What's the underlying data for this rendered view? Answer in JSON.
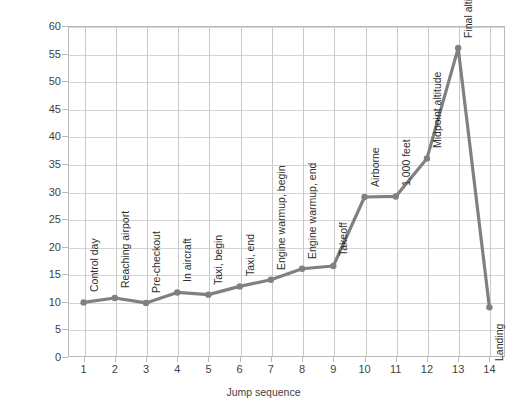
{
  "chart_data": {
    "type": "line",
    "title": "",
    "xlabel": "Jump sequence",
    "ylabel": "Conductance in microohms",
    "xlim": [
      0.5,
      14.5
    ],
    "ylim": [
      0,
      60
    ],
    "grid": true,
    "legend": "none",
    "x": [
      1,
      2,
      3,
      4,
      5,
      6,
      7,
      8,
      9,
      10,
      11,
      12,
      13,
      14
    ],
    "values": [
      9.9,
      10.7,
      9.8,
      11.7,
      11.3,
      12.8,
      14.0,
      16.0,
      16.5,
      29.0,
      29.1,
      36.0,
      56.0,
      9.0
    ],
    "categories": [
      "1",
      "2",
      "3",
      "4",
      "5",
      "6",
      "7",
      "8",
      "9",
      "10",
      "11",
      "12",
      "13",
      "14"
    ],
    "x_tick_labels": [
      "1",
      "2",
      "3",
      "4",
      "5",
      "6",
      "7",
      "8",
      "9",
      "10",
      "11",
      "12",
      "13",
      "14"
    ],
    "y_tick_labels": [
      "0",
      "5",
      "10",
      "15",
      "20",
      "25",
      "30",
      "35",
      "40",
      "45",
      "50",
      "55",
      "60"
    ],
    "y_ticks": [
      0,
      5,
      10,
      15,
      20,
      25,
      30,
      35,
      40,
      45,
      50,
      55,
      60
    ],
    "annotations": [
      {
        "x": 1,
        "text": "Control day"
      },
      {
        "x": 2,
        "text": "Reaching airport"
      },
      {
        "x": 3,
        "text": "Pre-checkout"
      },
      {
        "x": 4,
        "text": "In aircraft"
      },
      {
        "x": 5,
        "text": "Taxi, begin"
      },
      {
        "x": 6,
        "text": "Taxi, end"
      },
      {
        "x": 7,
        "text": "Engine warmup, begin"
      },
      {
        "x": 8,
        "text": "Engine warmup, end"
      },
      {
        "x": 9,
        "text": "Takeoff"
      },
      {
        "x": 10,
        "text": "Airborne"
      },
      {
        "x": 11,
        "text": "1,000 feet"
      },
      {
        "x": 12,
        "text": "Midpoint altitude"
      },
      {
        "x": 13,
        "text": "Final altitude"
      },
      {
        "x": 14,
        "text": "Landing"
      }
    ],
    "series_color": "#808080",
    "grid_color": "#d4d4d4",
    "axis_color": "#b9b9b9",
    "text_color": "#3f3f3f",
    "background": "#ffffff"
  }
}
